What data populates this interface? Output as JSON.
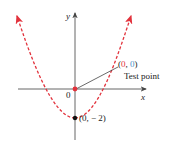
{
  "axes": {
    "x_label": "x",
    "y_label": "y",
    "origin_label": "0"
  },
  "curve": {
    "style": "dashed",
    "color": "#e2323c",
    "equation_shape": "upward parabola with vertex at (0, -2)"
  },
  "points": {
    "test_point": {
      "open": "(",
      "x": "0",
      "comma": ", ",
      "y": "0",
      "close": ")",
      "label": "Test point",
      "number_color": "#e2323c",
      "y_color": "#4a90c8"
    },
    "vertex": {
      "label": "(0, − 2)"
    }
  },
  "colors": {
    "axis": "#444444",
    "curve": "#e2323c",
    "test_point_dot": "#e2323c",
    "vertex_dot": "#111111"
  }
}
